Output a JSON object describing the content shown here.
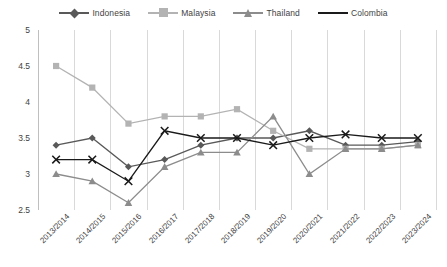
{
  "chart_data": {
    "type": "line",
    "title": "",
    "subtitle": "",
    "xlabel": "",
    "ylabel": "",
    "ylim": [
      2.5,
      5
    ],
    "yticks": [
      2.5,
      3,
      3.5,
      4,
      4.5,
      5
    ],
    "ytick_labels": [
      "2.5",
      "3",
      "3.5",
      "4",
      "4.5",
      "5"
    ],
    "grid": "vertical-only",
    "legend_position": "top-center",
    "categories": [
      "2013/2014",
      "2014/2015",
      "2015/2016",
      "2016/2017",
      "2017/2018",
      "2018/2019",
      "2019/2020",
      "2020/2021",
      "2021/2022",
      "2022/2023",
      "2023/2024"
    ],
    "series": [
      {
        "name": "Indonesia",
        "color": "#595959",
        "marker": "diamond",
        "values": [
          3.4,
          3.5,
          3.1,
          3.2,
          3.4,
          3.5,
          3.5,
          3.6,
          3.4,
          3.4,
          3.45
        ]
      },
      {
        "name": "Malaysia",
        "color": "#b3b3b3",
        "marker": "square",
        "values": [
          4.5,
          4.2,
          3.7,
          3.8,
          3.8,
          3.9,
          3.6,
          3.35,
          3.35,
          3.35,
          3.4
        ]
      },
      {
        "name": "Thailand",
        "color": "#8c8c8c",
        "marker": "triangle",
        "values": [
          3.0,
          2.9,
          2.6,
          3.1,
          3.3,
          3.3,
          3.8,
          3.0,
          3.35,
          3.35,
          3.4
        ]
      },
      {
        "name": "Colombia",
        "color": "#1a1a1a",
        "marker": "cross",
        "values": [
          3.2,
          3.2,
          2.9,
          3.6,
          3.5,
          3.5,
          3.4,
          3.5,
          3.55,
          3.5,
          3.5
        ]
      }
    ]
  },
  "legend": {
    "items": [
      {
        "label": "Indonesia",
        "color": "#595959",
        "icon": "diamond-marker-icon"
      },
      {
        "label": "Malaysia",
        "color": "#b3b3b3",
        "icon": "square-marker-icon"
      },
      {
        "label": "Thailand",
        "color": "#8c8c8c",
        "icon": "triangle-marker-icon"
      },
      {
        "label": "Colombia",
        "color": "#1a1a1a",
        "icon": "cross-marker-icon"
      }
    ]
  }
}
